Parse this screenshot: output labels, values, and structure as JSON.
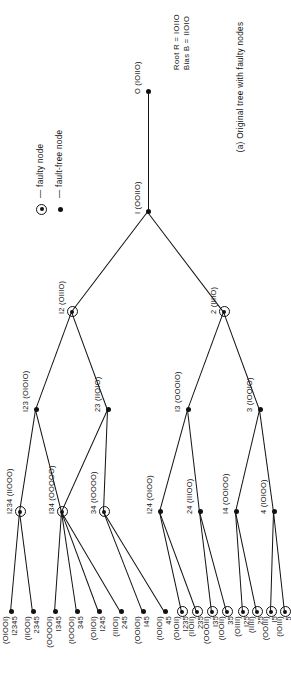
{
  "figure": {
    "caption": "(a) Original tree with faulty nodes",
    "legend": {
      "faulty_label": "— faulty node",
      "fault_free_label": "— fault-free node"
    },
    "root_info": {
      "root_line": "Root R = IOIIO",
      "bias_line": "Bias  B = IIOIO"
    },
    "colors": {
      "ink": "#111111",
      "paper": "#ffffff"
    },
    "nodes": [
      {
        "id": "root",
        "name": "I (OOIIO)",
        "label_main": "I (OOIIO)",
        "label_extra": "",
        "faulty": false
      },
      {
        "id": "zero",
        "name": "O (IOIIO)",
        "label_main": "O (IOIIO)",
        "label_extra": "",
        "faulty": false
      },
      {
        "id": "n12",
        "name": "I2 (OIIIO)",
        "label_main": "I2 (OIIIO)",
        "label_extra": "",
        "faulty": true
      },
      {
        "id": "n2",
        "name": "2 (IIIIO)",
        "label_main": "2 (IIIIO)",
        "label_extra": "",
        "faulty": true
      },
      {
        "id": "n123",
        "name": "I23 (OIOIO)",
        "label_main": "I23 (OIOIO)",
        "label_extra": "",
        "faulty": false
      },
      {
        "id": "n23",
        "name": "23 (IIOIO)",
        "label_main": "23 (IIOIO)",
        "label_extra": "",
        "faulty": false
      },
      {
        "id": "n13",
        "name": "I3 (OOOIO)",
        "label_main": "I3 (OOOIO)",
        "label_extra": "",
        "faulty": false
      },
      {
        "id": "n3",
        "name": "3 (IOOIO)",
        "label_main": "3 (IOOIO)",
        "label_extra": "",
        "faulty": false
      },
      {
        "id": "n1234",
        "name": "I234 (IIOOO)",
        "label_main": "I234 (IIOOO)",
        "label_extra": "",
        "faulty": true
      },
      {
        "id": "n134",
        "name": "I34 (OOOOO)",
        "label_main": "I34 (OOOOO)",
        "label_extra": "",
        "faulty": true
      },
      {
        "id": "n34",
        "name": "34 (IOOOO)",
        "label_main": "34 (IOOOO)",
        "label_extra": "",
        "faulty": true
      },
      {
        "id": "n124",
        "name": "I24 (OIOO)",
        "label_main": "I24 (OIOO)",
        "label_extra": "",
        "faulty": false
      },
      {
        "id": "n24",
        "name": "24 (IIIOO)",
        "label_main": "24 (IIIOO)",
        "label_extra": "",
        "faulty": false
      },
      {
        "id": "n14",
        "name": "I4 (OOIOO)",
        "label_main": "I4 (OOIOO)",
        "label_extra": "",
        "faulty": false
      },
      {
        "id": "n4",
        "name": "4 (IOIOO)",
        "label_main": "4 (IOIOO)",
        "label_extra": "",
        "faulty": false
      }
    ],
    "leaves": [
      {
        "id": "l12345",
        "code": "(OIOOI)",
        "num": "I2345",
        "faulty": false
      },
      {
        "id": "l2345",
        "code": "(IIOOI)",
        "num": "2345",
        "faulty": false
      },
      {
        "id": "l1345",
        "code": "(OOOOI)",
        "num": "I345",
        "faulty": false
      },
      {
        "id": "l345",
        "code": "(IOOOI)",
        "num": "345",
        "faulty": false
      },
      {
        "id": "l1245",
        "code": "(OIIOI)",
        "num": "I245",
        "faulty": false
      },
      {
        "id": "l245",
        "code": "(IIIOI)",
        "num": "245",
        "faulty": false
      },
      {
        "id": "l145",
        "code": "(OOIOI)",
        "num": "I45",
        "faulty": false
      },
      {
        "id": "l45",
        "code": "(IOIOI)",
        "num": "45",
        "faulty": false
      },
      {
        "id": "l235",
        "code": "(IIOII)",
        "num": "235",
        "faulty": true
      },
      {
        "id": "l1235",
        "code": "(OIOII)",
        "num": "I235",
        "faulty": true
      },
      {
        "id": "l35",
        "code": "(IOOII)",
        "num": "35",
        "faulty": true
      },
      {
        "id": "l135",
        "code": "(OOOII)",
        "num": "I35",
        "faulty": true
      },
      {
        "id": "l25",
        "code": "(IIIII)",
        "num": "25",
        "faulty": true
      },
      {
        "id": "l125",
        "code": "(OIIII)",
        "num": "I25",
        "faulty": true
      },
      {
        "id": "l5",
        "code": "(IOIII)",
        "num": "5",
        "faulty": true
      },
      {
        "id": "l15",
        "code": "(OOIII)",
        "num": "I5",
        "faulty": true
      }
    ]
  }
}
